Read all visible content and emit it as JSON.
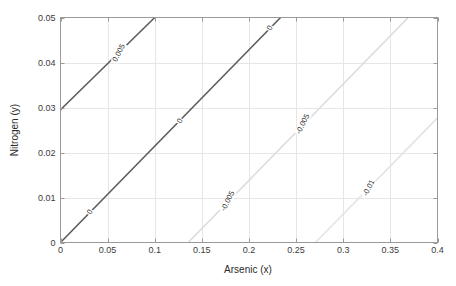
{
  "figure": {
    "background_color": "#ffffff",
    "axes_color": "#808080",
    "grid_color": "#e6e6e6",
    "tick_text_color": "#3b3b3b"
  },
  "axes": {
    "xlabel": "Arsenic (x)",
    "ylabel": "Nitrogen (y)",
    "xticks": [
      "0",
      "0.05",
      "0.1",
      "0.15",
      "0.2",
      "0.25",
      "0.3",
      "0.35",
      "0.4"
    ],
    "yticks": [
      "0",
      "0.01",
      "0.02",
      "0.03",
      "0.04",
      "0.05"
    ]
  },
  "chart_data": {
    "type": "line",
    "title": "",
    "xlabel": "Arsenic (x)",
    "ylabel": "Nitrogen (y)",
    "xlim": [
      0,
      0.4
    ],
    "ylim": [
      0,
      0.05
    ],
    "xticks": [
      0,
      0.05,
      0.1,
      0.15,
      0.2,
      0.25,
      0.3,
      0.35,
      0.4
    ],
    "yticks": [
      0,
      0.01,
      0.02,
      0.03,
      0.04,
      0.05
    ],
    "grid": true,
    "legend": "none",
    "plot_kind": "contour",
    "contour_levels": [
      0.005,
      0,
      -0.005,
      -0.01
    ],
    "series": [
      {
        "name": "0.005",
        "level": 0.005,
        "color": "#5c5c5c",
        "x": [
          0,
          0.1
        ],
        "y": [
          0.0295,
          0.05
        ],
        "label_text": "0.005",
        "label_x": 0.062,
        "label_y": 0.0422,
        "label_rotation": -63
      },
      {
        "name": "0",
        "level": 0,
        "color": "#5c5c5c",
        "x": [
          0,
          0.2335
        ],
        "y": [
          0,
          0.05
        ],
        "label_text": "0",
        "label_x": 0.0315,
        "label_y": 0.00675,
        "label_rotation": -63
      },
      {
        "name": "0-mid",
        "level": 0,
        "color": "#5c5c5c",
        "x": [],
        "y": [],
        "label_text": "0",
        "label_x": 0.1265,
        "label_y": 0.0271,
        "label_rotation": -63
      },
      {
        "name": "0-top",
        "level": 0,
        "color": "#5c5c5c",
        "x": [],
        "y": [],
        "label_text": "0",
        "label_x": 0.2225,
        "label_y": 0.0476,
        "label_rotation": -63
      },
      {
        "name": "-0.005",
        "level": -0.005,
        "color": "#dcdcdc",
        "x": [
          0.1355,
          0.369
        ],
        "y": [
          0,
          0.05
        ],
        "label_text": "-0.005",
        "label_x": 0.1775,
        "label_y": 0.0092,
        "label_rotation": -63
      },
      {
        "name": "-0.005-upper",
        "level": -0.005,
        "color": "#dcdcdc",
        "x": [],
        "y": [],
        "label_text": "-0.005",
        "label_x": 0.2575,
        "label_y": 0.0263,
        "label_rotation": -63
      },
      {
        "name": "-0.01",
        "level": -0.01,
        "color": "#e4e4e4",
        "x": [
          0.2705,
          0.4
        ],
        "y": [
          0,
          0.0277
        ],
        "label_text": "-0.01",
        "label_x": 0.3275,
        "label_y": 0.0122,
        "label_rotation": -63
      }
    ]
  }
}
